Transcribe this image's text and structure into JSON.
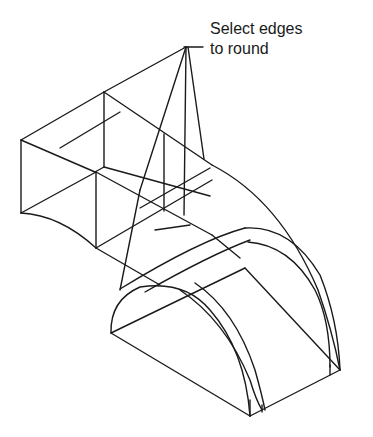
{
  "diagram": {
    "annotation": {
      "line1": "Select edges",
      "line2": "to round"
    },
    "colors": {
      "background": "#ffffff",
      "stroke": "#1a1a1a"
    }
  }
}
